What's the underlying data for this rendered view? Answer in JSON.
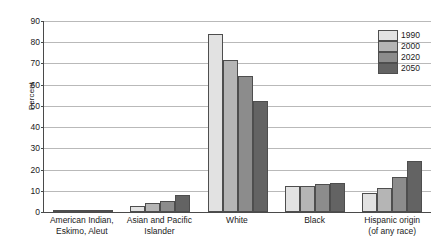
{
  "chart_data": {
    "type": "bar",
    "title": "",
    "xlabel": "",
    "ylabel": "Percent",
    "ylim": [
      0,
      90
    ],
    "yticks": [
      0,
      10,
      20,
      30,
      40,
      50,
      60,
      70,
      80,
      90
    ],
    "grid": true,
    "legend_position": "top-right",
    "categories": [
      "American Indian, Eskimo, Aleut",
      "Asian and Pacific Islander",
      "White",
      "Black",
      "Hispanic origin (of any race)"
    ],
    "category_lines": [
      [
        "American Indian,",
        "Eskimo, Aleut"
      ],
      [
        "Asian and Pacific",
        "Islander"
      ],
      [
        "White"
      ],
      [
        "Black"
      ],
      [
        "Hispanic origin",
        "(of any race)"
      ]
    ],
    "series": [
      {
        "name": "1990",
        "color": "#e2e2e2",
        "values": [
          0.8,
          2.8,
          83.9,
          12.3,
          9.0
        ]
      },
      {
        "name": "2000",
        "color": "#b5b5b5",
        "values": [
          0.9,
          4.4,
          71.4,
          12.4,
          11.3
        ]
      },
      {
        "name": "2020",
        "color": "#8c8c8c",
        "values": [
          1.0,
          5.4,
          63.9,
          13.2,
          16.3
        ]
      },
      {
        "name": "2050",
        "color": "#636363",
        "values": [
          1.1,
          7.9,
          52.3,
          13.6,
          24.0
        ]
      }
    ]
  },
  "legend": {
    "entries": [
      {
        "label": "1990"
      },
      {
        "label": "2000"
      },
      {
        "label": "2020"
      },
      {
        "label": "2050"
      }
    ]
  },
  "axis": {
    "y_title": "Percent",
    "y_tick_labels": [
      "90",
      "80",
      "70",
      "60",
      "50",
      "40",
      "30",
      "20",
      "10",
      "0"
    ]
  },
  "colors": {
    "axis": "#4a4a4a",
    "grid": "#b9b9b9",
    "bar_outline": "#4e4e4e",
    "background": "#ffffff"
  }
}
